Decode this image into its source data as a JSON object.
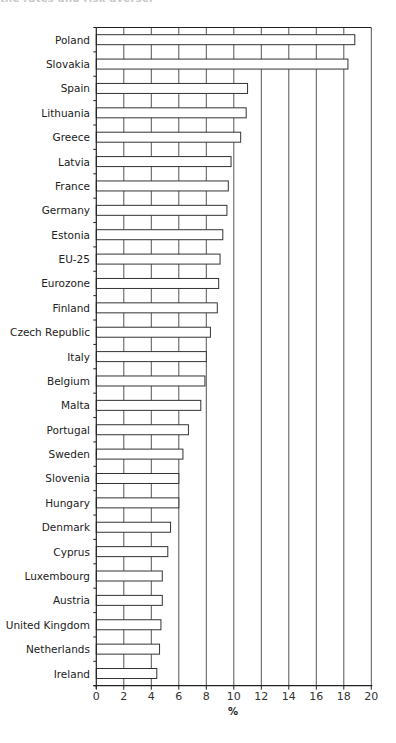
{
  "page": {
    "top_text": "the rates and risk averse.",
    "bottom_text": ""
  },
  "chart_data": {
    "type": "bar",
    "orientation": "horizontal",
    "title": "",
    "xlabel": "%",
    "ylabel": "",
    "xlim": [
      0,
      20
    ],
    "xticks": [
      0,
      2,
      4,
      6,
      8,
      10,
      12,
      14,
      16,
      18,
      20
    ],
    "grid": "vertical",
    "legend": null,
    "categories": [
      "Poland",
      "Slovakia",
      "Spain",
      "Lithuania",
      "Greece",
      "Latvia",
      "France",
      "Germany",
      "Estonia",
      "EU-25",
      "Eurozone",
      "Finland",
      "Czech Republic",
      "Italy",
      "Belgium",
      "Malta",
      "Portugal",
      "Sweden",
      "Slovenia",
      "Hungary",
      "Denmark",
      "Cyprus",
      "Luxembourg",
      "Austria",
      "United Kingdom",
      "Netherlands",
      "Ireland"
    ],
    "values": [
      18.8,
      18.3,
      11.0,
      10.9,
      10.5,
      9.8,
      9.6,
      9.5,
      9.2,
      9.0,
      8.9,
      8.8,
      8.3,
      8.0,
      7.9,
      7.6,
      6.7,
      6.3,
      6.0,
      6.0,
      5.4,
      5.2,
      4.8,
      4.8,
      4.7,
      4.6,
      4.4
    ],
    "colors": {
      "bar_fill": "#ffffff",
      "bar_stroke": "#333333",
      "grid": "#555555",
      "axis": "#222222"
    }
  }
}
